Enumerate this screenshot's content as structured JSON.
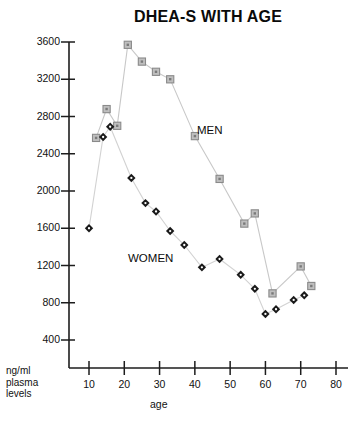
{
  "chart_data": {
    "type": "scatter",
    "title": "DHEA-S WITH AGE",
    "xlabel": "age",
    "ylabel": "ng/ml plasma levels",
    "xlim": [
      0,
      80
    ],
    "ylim": [
      0,
      3600
    ],
    "grid": false,
    "legend_position": "inline-annotations",
    "xticks": [
      "10",
      "20",
      "30",
      "40",
      "50",
      "60",
      "70",
      "80"
    ],
    "xtick_values": [
      10,
      20,
      30,
      40,
      50,
      60,
      70,
      80
    ],
    "yticks": [
      "400",
      "800",
      "1200",
      "1600",
      "2000",
      "2400",
      "2800",
      "3200",
      "3600"
    ],
    "ytick_values": [
      400,
      800,
      1200,
      1600,
      2000,
      2400,
      2800,
      3200,
      3600
    ],
    "series": [
      {
        "name": "MEN",
        "marker": "square",
        "color": "#8c8c8c",
        "line_color": "#c8c8c8",
        "points": [
          {
            "x": 12,
            "y": 2570
          },
          {
            "x": 15,
            "y": 2880
          },
          {
            "x": 18,
            "y": 2700
          },
          {
            "x": 21,
            "y": 3570
          },
          {
            "x": 25,
            "y": 3390
          },
          {
            "x": 29,
            "y": 3280
          },
          {
            "x": 33,
            "y": 3200
          },
          {
            "x": 40,
            "y": 2590
          },
          {
            "x": 47,
            "y": 2130
          },
          {
            "x": 54,
            "y": 1650
          },
          {
            "x": 57,
            "y": 1760
          },
          {
            "x": 62,
            "y": 900
          },
          {
            "x": 70,
            "y": 1190
          },
          {
            "x": 73,
            "y": 980
          }
        ]
      },
      {
        "name": "WOMEN",
        "marker": "diamond",
        "color": "#1a1a1a",
        "line_color": "#d2d2d2",
        "points": [
          {
            "x": 10,
            "y": 1600
          },
          {
            "x": 14,
            "y": 2580
          },
          {
            "x": 16,
            "y": 2690
          },
          {
            "x": 22,
            "y": 2140
          },
          {
            "x": 26,
            "y": 1870
          },
          {
            "x": 29,
            "y": 1780
          },
          {
            "x": 33,
            "y": 1570
          },
          {
            "x": 37,
            "y": 1420
          },
          {
            "x": 42,
            "y": 1180
          },
          {
            "x": 47,
            "y": 1270
          },
          {
            "x": 53,
            "y": 1100
          },
          {
            "x": 57,
            "y": 950
          },
          {
            "x": 60,
            "y": 680
          },
          {
            "x": 63,
            "y": 730
          },
          {
            "x": 68,
            "y": 830
          },
          {
            "x": 71,
            "y": 880
          }
        ]
      }
    ],
    "annotations": [
      {
        "text": "MEN",
        "x": 44,
        "y": 2460
      },
      {
        "text": "WOMEN",
        "x": 27,
        "y": 1080
      }
    ]
  },
  "axis_caption": {
    "y_line1": "ng/ml",
    "y_line2": "plasma",
    "y_line3": "levels",
    "x_caption": "age"
  },
  "colors": {
    "axis": "#1d1d1d",
    "men_marker": "#8c8c8c",
    "women_marker": "#1a1a1a",
    "men_line": "#cccccc",
    "women_line": "#d6d6d6",
    "title": "#0a0a0a"
  }
}
